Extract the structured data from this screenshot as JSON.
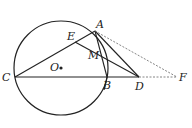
{
  "diagram": {
    "type": "geometry",
    "circle": {
      "center_label": "O",
      "cx": 61,
      "cy": 68,
      "r": 47
    },
    "points": {
      "A": {
        "label": "A",
        "x": 95,
        "y": 31
      },
      "B": {
        "label": "B",
        "x": 107,
        "y": 77
      },
      "C": {
        "label": "C",
        "x": 15,
        "y": 77
      },
      "D": {
        "label": "D",
        "x": 139,
        "y": 77
      },
      "E": {
        "label": "E",
        "x": 75,
        "y": 42
      },
      "F": {
        "label": "F",
        "x": 177,
        "y": 77
      },
      "M": {
        "label": "M",
        "x": 99,
        "y": 53
      },
      "O": {
        "label": "O",
        "x": 61,
        "y": 68
      }
    },
    "solid_segments": [
      "CA",
      "CB",
      "BD",
      "AB",
      "AD",
      "ED"
    ],
    "dashed_segments": [
      "AF",
      "DF"
    ],
    "colors": {
      "stroke": "#222222",
      "dashed": "#666666",
      "background": "#ffffff"
    }
  }
}
